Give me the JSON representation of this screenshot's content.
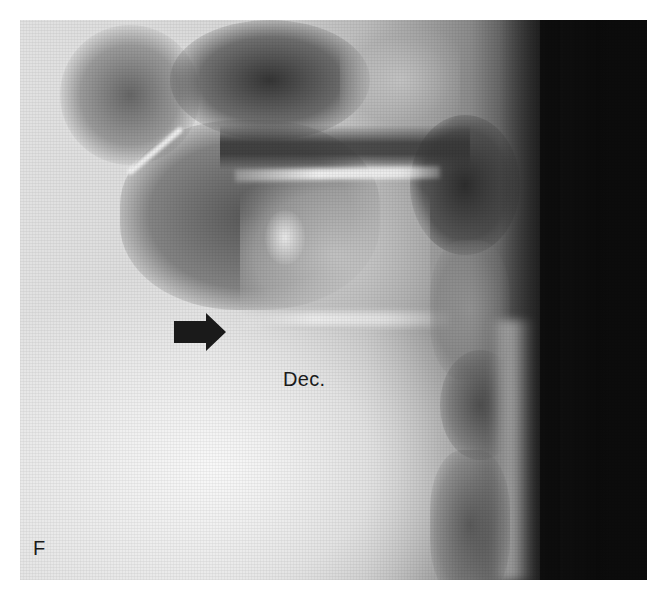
{
  "figure": {
    "panel_label": "F",
    "image": {
      "subject": "lateral lumbar spine radiograph",
      "annotation_text": "Dec.",
      "annotation_icon": "right-arrow-icon",
      "colors": {
        "arrow": "#1a1a1a",
        "label": "#1a1a1a",
        "background": "#ffffff"
      }
    }
  }
}
